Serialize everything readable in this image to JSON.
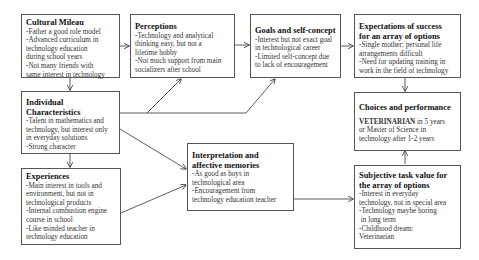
{
  "diagram": {
    "boxes": {
      "cultural_milieu": {
        "title": "Cultural Mileau",
        "lines": [
          "-Father a good role model",
          "-Advanced curriculum in",
          "technology education",
          "during school years",
          "-Not many friends with",
          "same interest in technology"
        ]
      },
      "perceptions": {
        "title": "Perceptions",
        "lines": [
          "-Technology and analytical",
          "thinking easy, but not a",
          "lifetime hobby",
          "-Not much support from main",
          "socializers after school"
        ]
      },
      "goals": {
        "title": "Goals and self-concept",
        "lines": [
          "-Interest but not exact goal",
          "in technological career",
          "-Limited self-concept due",
          "to lack of encouragement"
        ]
      },
      "expectations": {
        "title_line1": "Expectations of success",
        "title_line2": "for an array of options",
        "lines": [
          "-Single mother:  personal life",
          "arrangements difficult",
          "-Need for updating training in",
          "work in the field of technology"
        ]
      },
      "individual": {
        "title_line1": "Individual",
        "title_line2": "Characteristics",
        "lines": [
          "-Talent in mathematics and",
          "technology, but interest only",
          "in everyday solutions",
          "-Strong character"
        ]
      },
      "choices": {
        "title": "Choices and performance",
        "highlight": "VETERINARIAN",
        "line1_rest": " in 5 years",
        "lines": [
          "or Master of Science in",
          "technology after 1-2 years"
        ]
      },
      "experiences": {
        "title": "Experiences",
        "lines": [
          "-Main interest in tools and",
          "environment, but not in",
          "technological products",
          "-Internal combustion engine",
          "course in school",
          "-Like minded teacher in",
          "technology education"
        ]
      },
      "interpretation": {
        "title_line1": "Interpretation and",
        "title_line2": "affective memories",
        "lines": [
          "-As good as boys in",
          "technological area",
          "-Encouragement from",
          "technology education teacher"
        ]
      },
      "subjective": {
        "title_line1": "Subjective task value for",
        "title_line2": "the array of options",
        "lines": [
          "-Interest in everyday",
          "technology, not in special area",
          "-Technology maybe boring",
          " in long term",
          "-Childhood dream:",
          "Veterinarian"
        ]
      }
    },
    "connections": [
      {
        "from": "Cultural Mileau",
        "to": "Perceptions"
      },
      {
        "from": "Cultural Mileau",
        "to": "Individual Characteristics"
      },
      {
        "from": "Perceptions",
        "to": "Goals and self-concept"
      },
      {
        "from": "Goals and self-concept",
        "to": "Expectations of success for an array of options"
      },
      {
        "from": "Expectations of success for an array of options",
        "to": "Choices and performance"
      },
      {
        "from": "Individual Characteristics",
        "to": "Perceptions"
      },
      {
        "from": "Individual Characteristics",
        "to": "Goals and self-concept"
      },
      {
        "from": "Individual Characteristics",
        "to": "Interpretation and affective memories"
      },
      {
        "from": "Individual Characteristics",
        "to": "Experiences"
      },
      {
        "from": "Experiences",
        "to": "Interpretation and affective memories"
      },
      {
        "from": "Interpretation and affective memories",
        "to": "Subjective task value for the array of options"
      },
      {
        "from": "Subjective task value for the array of options",
        "to": "Choices and performance"
      }
    ],
    "colors": {
      "border": "#555555",
      "arrow": "#333333",
      "background": "#ffffff"
    }
  }
}
